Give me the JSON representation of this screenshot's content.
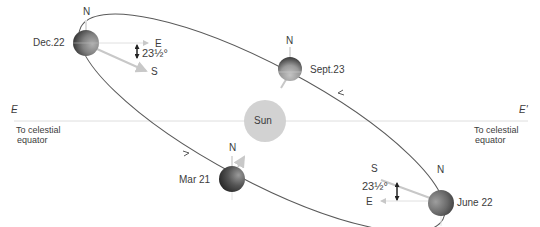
{
  "diagram": {
    "sun": {
      "label": "Sun",
      "color": "#d0d0d0"
    },
    "reference_line": {
      "left_label": "E",
      "right_label": "E'",
      "left_caption_line1": "To celestial",
      "left_caption_line2": "equator",
      "right_caption_line1": "To celestial",
      "right_caption_line2": "equator"
    },
    "positions": [
      {
        "id": "dec",
        "date": "Dec.22",
        "north": "N",
        "east": "E",
        "south": "S",
        "tilt": "23½°"
      },
      {
        "id": "sept",
        "date": "Sept.23",
        "north": "N"
      },
      {
        "id": "mar",
        "date": "Mar 21",
        "north": "N"
      },
      {
        "id": "june",
        "date": "June 22",
        "north": "N",
        "east": "E",
        "south": "S",
        "tilt": "23½°"
      }
    ],
    "colors": {
      "orbit": "#555555",
      "equator_line": "#d8d8d8",
      "earth_dark": "#2a2a2a",
      "earth_light": "#a8a8a8",
      "axis_arrow": "#c8c8c8"
    }
  }
}
